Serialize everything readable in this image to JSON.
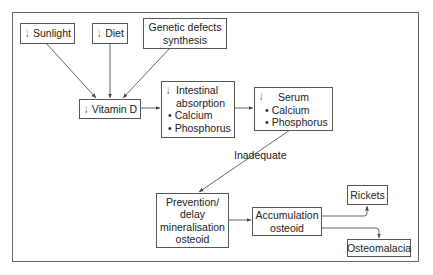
{
  "diagram": {
    "icons": {
      "decrease": "down-arrow-icon"
    },
    "nodes": {
      "sunlight": {
        "label": "Sunlight",
        "decreased": true
      },
      "diet": {
        "label": "Diet",
        "decreased": true
      },
      "genetic": {
        "line1": "Genetic defects",
        "line2": "synthesis"
      },
      "vitamin_d": {
        "label": "Vitamin D",
        "decreased": true
      },
      "intestinal": {
        "line1": "Intestinal",
        "line2": "absorption",
        "items": [
          "Calcium",
          "Phosphorus"
        ],
        "decreased": true
      },
      "serum": {
        "title": "Serum",
        "items": [
          "Calcium",
          "Phosphorus"
        ],
        "decreased": true
      },
      "prevention": {
        "line1": "Prevention/",
        "line2": "delay",
        "line3": "mineralisation",
        "line4": "osteoid"
      },
      "accumulation": {
        "line1": "Accumulation",
        "line2": "osteoid"
      },
      "rickets": {
        "label": "Rickets"
      },
      "osteomalacia": {
        "label": "Osteomalacia"
      }
    },
    "edge_labels": {
      "serum_to_prevention": "Inadequate"
    },
    "down_glyph": "↓",
    "colors": {
      "line": "#555555",
      "border": "#666666",
      "text": "#222222"
    }
  }
}
